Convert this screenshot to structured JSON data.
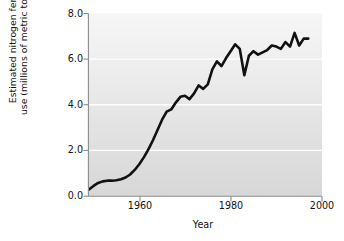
{
  "chart_data": {
    "type": "line",
    "title": "",
    "xlabel": "Year",
    "ylabel_line1": "Estimated nitrogen fertilizer",
    "ylabel_line2": "use (millions of metric tons/year)",
    "ylabel": "Estimated nitrogen fertilizer use (millions of metric tons/year)",
    "xlim": [
      1949,
      2000
    ],
    "ylim": [
      0.0,
      8.0
    ],
    "xticks": [
      1960,
      1980,
      2000
    ],
    "xticklabels": [
      "1960",
      "1980",
      "2000"
    ],
    "yticks": [
      0.0,
      2.0,
      4.0,
      6.0,
      8.0
    ],
    "yticklabels": [
      "0.0",
      "2.0",
      "4.0",
      "6.0",
      "8.0"
    ],
    "grid": "horizontal-white-gridlines",
    "legend": "none",
    "line_color": "#111111",
    "line_width": 2.6,
    "plot_bg_top": "#f4f4f4",
    "plot_bg_bottom": "#d9d9d9",
    "gridline_color": "#ffffff",
    "axis_color": "#7a7a7a",
    "series": [
      {
        "name": "Estimated nitrogen fertilizer use",
        "x": [
          1949,
          1950,
          1951,
          1952,
          1953,
          1954,
          1955,
          1956,
          1957,
          1958,
          1959,
          1960,
          1961,
          1962,
          1963,
          1964,
          1965,
          1966,
          1967,
          1968,
          1969,
          1970,
          1971,
          1972,
          1973,
          1974,
          1975,
          1976,
          1977,
          1978,
          1979,
          1980,
          1981,
          1982,
          1983,
          1984,
          1985,
          1986,
          1987,
          1988,
          1989,
          1990,
          1991,
          1992,
          1993,
          1994,
          1995,
          1996,
          1997
        ],
        "y": [
          0.3,
          0.45,
          0.58,
          0.65,
          0.68,
          0.68,
          0.7,
          0.74,
          0.82,
          0.95,
          1.15,
          1.4,
          1.7,
          2.05,
          2.45,
          2.9,
          3.35,
          3.7,
          3.8,
          4.1,
          4.35,
          4.4,
          4.25,
          4.5,
          4.85,
          4.7,
          4.9,
          5.55,
          5.9,
          5.7,
          6.05,
          6.35,
          6.65,
          6.45,
          5.3,
          6.15,
          6.35,
          6.2,
          6.3,
          6.4,
          6.6,
          6.55,
          6.45,
          6.75,
          6.55,
          7.15,
          6.6,
          6.9,
          6.9
        ]
      }
    ]
  },
  "figure": {
    "background_color": "#ffffff",
    "width": 344,
    "height": 241
  }
}
